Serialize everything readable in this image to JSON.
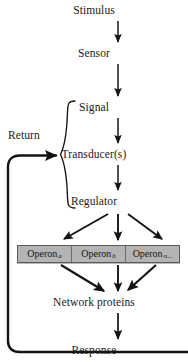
{
  "diagram": {
    "background_color": "#ffffff",
    "line_color": "#141414",
    "nodes": {
      "stimulus": "Stimulus",
      "sensor": "Sensor",
      "signal": "Signal",
      "transducers": "Transducer(s)",
      "regulator": "Regulator",
      "network_proteins": "Network proteins",
      "response": "Response",
      "return_label": "Return"
    },
    "operons": {
      "box_fill_color": "#b4b4b4",
      "box_border_color": "#59595b",
      "items": [
        {
          "name": "Operon",
          "subscript": "a"
        },
        {
          "name": "Operon",
          "subscript": "b"
        },
        {
          "name": "Operon",
          "subscript": "n..."
        }
      ]
    },
    "brace": {
      "groups": [
        "Signal",
        "Transducer(s)",
        "Regulator"
      ],
      "position": "left"
    },
    "edges": [
      {
        "from": "Stimulus",
        "to": "Sensor",
        "style": "straight-arrow"
      },
      {
        "from": "Sensor",
        "to": "Signal",
        "style": "straight-arrow"
      },
      {
        "from": "Signal",
        "to": "Transducer(s)",
        "style": "straight-arrow"
      },
      {
        "from": "Transducer(s)",
        "to": "Regulator",
        "style": "straight-arrow"
      },
      {
        "from": "Regulator",
        "to": "Operon a",
        "style": "diagonal-arrow"
      },
      {
        "from": "Regulator",
        "to": "Operon b",
        "style": "straight-arrow"
      },
      {
        "from": "Regulator",
        "to": "Operon n...",
        "style": "diagonal-arrow"
      },
      {
        "from": "Operon a",
        "to": "Network proteins",
        "style": "diagonal-arrow"
      },
      {
        "from": "Operon b",
        "to": "Network proteins",
        "style": "straight-arrow"
      },
      {
        "from": "Operon n...",
        "to": "Network proteins",
        "style": "diagonal-arrow"
      },
      {
        "from": "Network proteins",
        "to": "Response",
        "style": "straight-arrow"
      },
      {
        "from": "Response",
        "to": "Return",
        "style": "feedback-loop-arrow"
      }
    ]
  }
}
